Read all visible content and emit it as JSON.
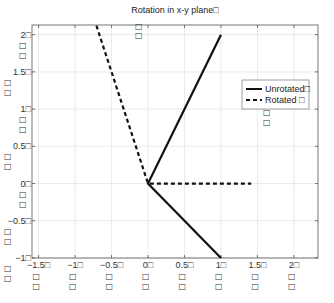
{
  "chart_data": {
    "type": "line",
    "title": "Rotation in x-y plane□",
    "xlabel": "",
    "ylabel": "",
    "xlim": [
      -1.59,
      2.33
    ],
    "ylim": [
      -1,
      2.13
    ],
    "grid": true,
    "legend_position": "top-right",
    "x_ticks": [
      -1.5,
      -1,
      -0.5,
      0,
      0.5,
      1,
      1.5,
      2
    ],
    "x_tick_labels": [
      "−1.5□",
      "−1□",
      "−0.5□",
      "0□",
      "0.5□",
      "1□",
      "1.5□",
      "2□"
    ],
    "y_ticks": [
      -1,
      -0.5,
      0,
      0.5,
      1,
      1.5,
      2
    ],
    "y_tick_labels": [
      "−1□",
      "−0.5□",
      "0□",
      "0.5□",
      "1□",
      "1.5□",
      "2□"
    ],
    "extra_glyph": "□",
    "series": [
      {
        "name": "Unrotated□",
        "style": "solid",
        "color": "#111111",
        "x": [
          1,
          0,
          1
        ],
        "y": [
          2,
          0,
          -1
        ]
      },
      {
        "name": "Rotated  □",
        "style": "dashed",
        "color": "#111111",
        "x": [
          -0.7071,
          0,
          1.4142
        ],
        "y": [
          2.1213,
          0,
          0
        ]
      }
    ]
  },
  "colors": {
    "axis": "#555555",
    "grid": "#e4e4e4",
    "line": "#111111"
  }
}
